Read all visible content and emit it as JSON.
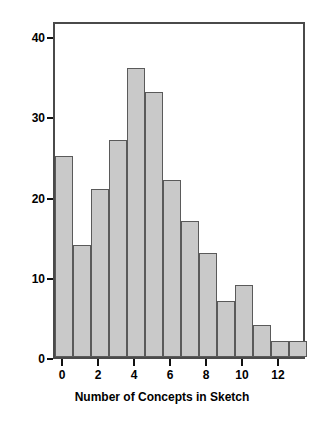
{
  "chart_data": {
    "type": "bar",
    "title": "",
    "xlabel": "Number of Concepts in Sketch",
    "ylabel": "Frequency",
    "categories": [
      "0",
      "1",
      "2",
      "3",
      "4",
      "5",
      "6",
      "7",
      "8",
      "9",
      "10",
      "11",
      "12",
      "13"
    ],
    "values": [
      25,
      14,
      21,
      27,
      36,
      33,
      22,
      17,
      13,
      7,
      9,
      4,
      2,
      2
    ],
    "xtick_labels": [
      "0",
      "2",
      "4",
      "6",
      "8",
      "10",
      "12"
    ],
    "xtick_values": [
      0,
      2,
      4,
      6,
      8,
      10,
      12
    ],
    "ytick_labels": [
      "0",
      "10",
      "20",
      "30",
      "40"
    ],
    "ytick_values": [
      0,
      10,
      20,
      30,
      40
    ],
    "xlim": [
      -0.5,
      13.5
    ],
    "ylim": [
      0,
      42
    ],
    "grid": false,
    "legend": null,
    "colors": {
      "bar_fill": "#c9c9c9",
      "bar_edge": "#5a5a5a",
      "frame": "#4a4a4a",
      "text": "#000000",
      "background": "#ffffff"
    }
  }
}
